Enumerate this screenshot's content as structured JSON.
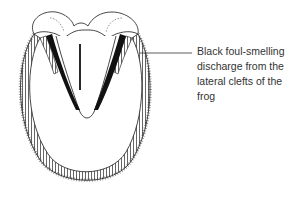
{
  "figure": {
    "callouts": [
      {
        "label": "Black foul-smelling discharge from the lateral clefts of the frog",
        "lines": [
          "Black   foul-smelling",
          "discharge  from  the",
          "lateral  clefts  of  the",
          "frog"
        ]
      }
    ]
  },
  "colors": {
    "ink": "#222222",
    "discharge": "#111111",
    "text": "#333333",
    "background": "#ffffff"
  }
}
